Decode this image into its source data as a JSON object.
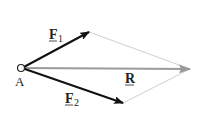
{
  "diagram": {
    "point_label": "A",
    "vectors": [
      {
        "id": "F1",
        "label_main": "F",
        "label_sub": "1",
        "color": "#111111"
      },
      {
        "id": "F2",
        "label_main": "F",
        "label_sub": "2",
        "color": "#111111"
      },
      {
        "id": "R",
        "label_main": "R",
        "label_sub": "",
        "color": "#999999"
      }
    ],
    "construction_line_color": "#cccccc"
  }
}
